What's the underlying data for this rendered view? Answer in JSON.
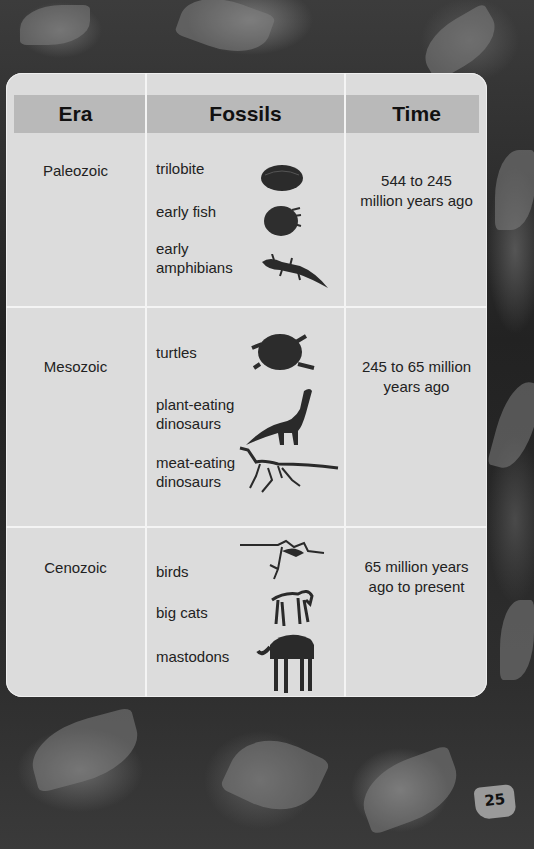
{
  "table": {
    "headers": [
      "Era",
      "Fossils",
      "Time"
    ],
    "rows": [
      {
        "era": "Paleozoic",
        "fossils": [
          "trilobite",
          "early fish",
          "early amphibians"
        ],
        "fossil_icons": [
          "trilobite-icon",
          "early-fish-icon",
          "amphibian-icon"
        ],
        "time": "544 to 245 million years ago"
      },
      {
        "era": "Mesozoic",
        "fossils": [
          "turtles",
          "plant-eating dinosaurs",
          "meat-eating dinosaurs"
        ],
        "fossil_icons": [
          "turtle-icon",
          "sauropod-icon",
          "theropod-skeleton-icon"
        ],
        "time": "245 to 65 million years ago"
      },
      {
        "era": "Cenozoic",
        "fossils": [
          "birds",
          "big cats",
          "mastodons"
        ],
        "fossil_icons": [
          "bird-skeleton-icon",
          "cat-skeleton-icon",
          "mastodon-skeleton-icon"
        ],
        "time": "65 million years ago to present"
      }
    ]
  },
  "labels": {
    "r0_time_l1": "544 to 245",
    "r0_time_l2": "million years ago",
    "r1_time_l1": "245 to 65 million",
    "r1_time_l2": "years ago",
    "r2_time_l1": "65 million years",
    "r2_time_l2": "ago to present",
    "r0_f2_l1": "early",
    "r0_f2_l2": "amphibians",
    "r1_f1_l1": "plant-eating",
    "r1_f1_l2": "dinosaurs",
    "r1_f2_l1": "meat-eating",
    "r1_f2_l2": "dinosaurs"
  },
  "page": {
    "number": "25"
  },
  "colors": {
    "card_bg": "#dcdcdc",
    "header_band": "#b9b9b9",
    "divider": "#f4f4f4",
    "text": "#222222"
  }
}
